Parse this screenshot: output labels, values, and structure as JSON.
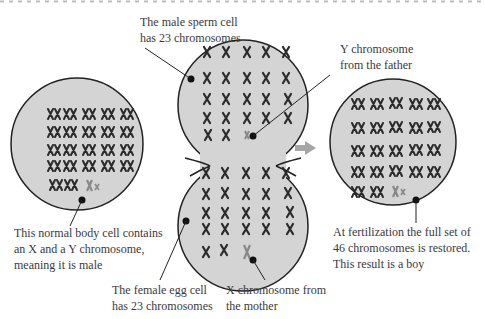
{
  "diagram": {
    "colors": {
      "cell_fill": "#d4d4d4",
      "cell_stroke": "#222222",
      "chromosome": "#2a2a2a",
      "sex_chromosome": "#888888",
      "arrow": "#a6a6a6",
      "text": "#3a3a3a",
      "dashes": "#bdbdbd"
    },
    "labels": {
      "sperm": {
        "line1": "The male sperm cell",
        "line2": "has 23 chromosomes"
      },
      "y_chrom": {
        "line1": "Y chromosome",
        "line2": "from the father"
      },
      "body_cell": {
        "line1": "This normal body cell contains",
        "line2": "an X and a Y chromosome,",
        "line3": "meaning it is male"
      },
      "egg": {
        "line1": "The female egg cell",
        "line2": "has 23 chromosomes"
      },
      "x_chrom": {
        "line1": "X chromosome from",
        "line2": "the mother"
      },
      "result": {
        "line1": "At fertilization the full set of",
        "line2": "46 chromosomes is restored.",
        "line3": "This result is a boy"
      }
    },
    "cells": [
      {
        "name": "male-body-cell",
        "chromosome_count": 46,
        "sex_chromosomes": "XY"
      },
      {
        "name": "sperm-cell",
        "chromosome_count": 23,
        "sex_chromosomes": "Y"
      },
      {
        "name": "egg-cell",
        "chromosome_count": 23,
        "sex_chromosomes": "X"
      },
      {
        "name": "zygote-cell",
        "chromosome_count": 46,
        "sex_chromosomes": "XY"
      }
    ],
    "arrow_icon": "right-arrow-icon"
  }
}
